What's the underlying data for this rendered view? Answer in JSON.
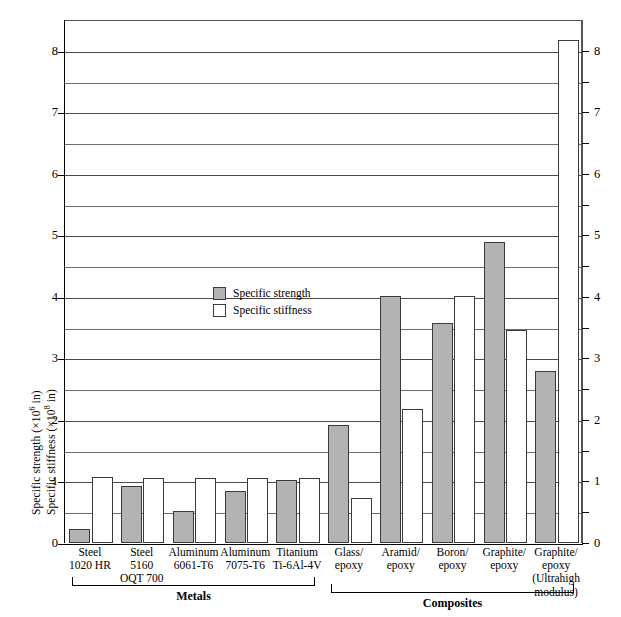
{
  "chart_data": {
    "type": "bar",
    "title": "",
    "subtitle": "",
    "xlabel": "",
    "ylabel_line1": "Specific strength (×10⁶ in)",
    "ylabel_line2": "Specific stiffness (×10⁸ in)",
    "ylabel_1_text": "Specific strength (",
    "ylabel_1_mult": "×10",
    "ylabel_1_exp": "6",
    "ylabel_1_unit": " in)",
    "ylabel_2_text": "Specific stiffness (",
    "ylabel_2_mult": "×10",
    "ylabel_2_exp": "8",
    "ylabel_2_unit": " in)",
    "ylim": [
      0,
      8.5
    ],
    "ytick_labels": [
      "0",
      "1",
      "2",
      "3",
      "4",
      "5",
      "6",
      "7",
      "8"
    ],
    "ytick_values": [
      0,
      1,
      2,
      3,
      4,
      5,
      6,
      7,
      8
    ],
    "minor_gridline_values": [
      0.5,
      1.5,
      2.5,
      3.5,
      4.5,
      5.5,
      6.5,
      7.5
    ],
    "grid": "horizontal",
    "right_axis": true,
    "right_ytick_labels": [
      "0",
      "1",
      "2",
      "3",
      "4",
      "5",
      "6",
      "7",
      "8"
    ],
    "legend_position": "inside-left-upper",
    "categories": [
      "Steel 1020 HR",
      "Steel 5160 OQT 700",
      "Aluminum 6061-T6",
      "Aluminum 7075-T6",
      "Titanium Ti-6Al-4V",
      "Glass/epoxy",
      "Aramid/epoxy",
      "Boron/epoxy",
      "Graphite/epoxy",
      "Graphite/epoxy (Ultrahigh modulus)"
    ],
    "series": [
      {
        "name": "Specific strength",
        "color": "#b3b3b3",
        "values": [
          0.22,
          0.93,
          0.52,
          0.84,
          1.03,
          1.92,
          4.02,
          3.58,
          4.9,
          2.8
        ]
      },
      {
        "name": "Specific stiffness",
        "color": "#ffffff",
        "values": [
          1.07,
          1.06,
          1.05,
          1.05,
          1.06,
          0.73,
          2.17,
          4.02,
          3.46,
          8.18
        ]
      }
    ]
  },
  "legend": {
    "items": [
      {
        "label": "Specific strength",
        "swatch": "strength"
      },
      {
        "label": "Specific stiffness",
        "swatch": "stiffness"
      }
    ],
    "item0_label": "Specific strength",
    "item1_label": "Specific stiffness"
  },
  "xaxis": {
    "labels": [
      {
        "line1": "Steel",
        "line2": "1020 HR",
        "line3": "",
        "line4": ""
      },
      {
        "line1": "Steel",
        "line2": "5160",
        "line3": "OQT 700",
        "line4": ""
      },
      {
        "line1": "Aluminum",
        "line2": "6061-T6",
        "line3": "",
        "line4": ""
      },
      {
        "line1": "Aluminum",
        "line2": "7075-T6",
        "line3": "",
        "line4": ""
      },
      {
        "line1": "Titanium",
        "line2": "Ti-6Al-4V",
        "line3": "",
        "line4": ""
      },
      {
        "line1": "Glass/",
        "line2": "epoxy",
        "line3": "",
        "line4": ""
      },
      {
        "line1": "Aramid/",
        "line2": "epoxy",
        "line3": "",
        "line4": ""
      },
      {
        "line1": "Boron/",
        "line2": "epoxy",
        "line3": "",
        "line4": ""
      },
      {
        "line1": "Graphite/",
        "line2": "epoxy",
        "line3": "",
        "line4": ""
      },
      {
        "line1": "Graphite/",
        "line2": "epoxy",
        "line3": "(Ultrahigh",
        "line4": "modulus)"
      }
    ]
  },
  "groups": {
    "metals_label": "Metals",
    "composites_label": "Composites"
  }
}
